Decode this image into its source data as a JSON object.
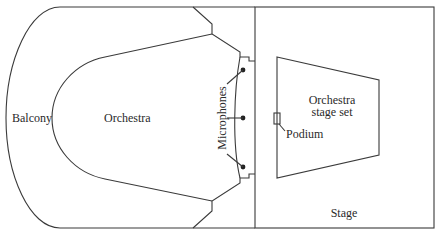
{
  "diagram": {
    "type": "concert hall floor plan",
    "labels": {
      "balcony": "Balcony",
      "orchestra": "Orchestra",
      "microphones": "Microphones",
      "stage_set_line1": "Orchestra",
      "stage_set_line2": "stage set",
      "podium": "Podium",
      "stage": "Stage"
    },
    "microphones": [
      {
        "x": 243,
        "y": 70
      },
      {
        "x": 243,
        "y": 118
      },
      {
        "x": 243,
        "y": 167
      }
    ],
    "colors": {
      "line": "#3a3a3a",
      "text": "#2a2a2a",
      "background": "#ffffff"
    }
  }
}
